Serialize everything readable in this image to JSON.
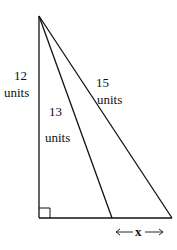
{
  "diagram": {
    "type": "geometry-triangles",
    "colors": {
      "stroke": "#111111",
      "background": "#ffffff"
    },
    "labels": {
      "vertical_leg_value": "12",
      "vertical_leg_unit": "units",
      "middle_segment_value": "13",
      "middle_segment_unit": "units",
      "hypotenuse_value": "15",
      "hypotenuse_unit": "units",
      "base_segment_variable": "x"
    },
    "right_angle_marker": true
  }
}
